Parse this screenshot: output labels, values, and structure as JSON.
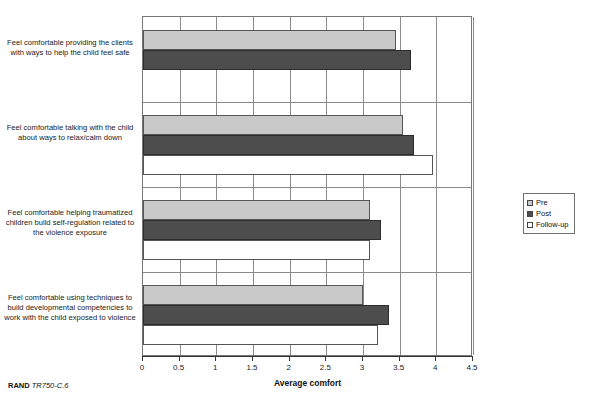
{
  "figure": {
    "faint_title": "",
    "footer_source": "RAND",
    "footer_code": "TR750-C.6"
  },
  "legend": {
    "items": [
      {
        "label": "Pre",
        "color": "#c9c9c9"
      },
      {
        "label": "Post",
        "color": "#4d4d4d"
      },
      {
        "label": "Follow-up",
        "color": "#ffffff"
      }
    ]
  },
  "chart_data": {
    "type": "bar",
    "orientation": "horizontal",
    "title": "",
    "xlabel": "Average comfort",
    "ylabel": "",
    "xlim": [
      0,
      4.5
    ],
    "xticks": [
      0,
      0.5,
      1,
      1.5,
      2,
      2.5,
      3,
      3.5,
      4,
      4.5
    ],
    "xtick_labels": [
      "0",
      "0.5",
      "1",
      "1.5",
      "2",
      "2.5",
      "3",
      "3.5",
      "4",
      "4.5"
    ],
    "grid": true,
    "legend_position": "right",
    "categories": [
      "Feel comfortable providing the clients with ways to help the child feel safe",
      "Feel comfortable talking with the child about ways to relax/calm down",
      "Feel comfortable helping traumatized children build self-regulation related to the violence exposure",
      "Feel comfortable using techniques to build developmental competencies to work with the child exposed to violence"
    ],
    "series": [
      {
        "name": "Pre",
        "color": "#c9c9c9",
        "values": [
          3.45,
          3.55,
          3.1,
          3.0
        ]
      },
      {
        "name": "Post",
        "color": "#4d4d4d",
        "values": [
          3.65,
          3.7,
          3.25,
          3.35
        ]
      },
      {
        "name": "Follow-up",
        "color": "#ffffff",
        "values": [
          null,
          3.95,
          3.1,
          3.2
        ]
      }
    ]
  }
}
